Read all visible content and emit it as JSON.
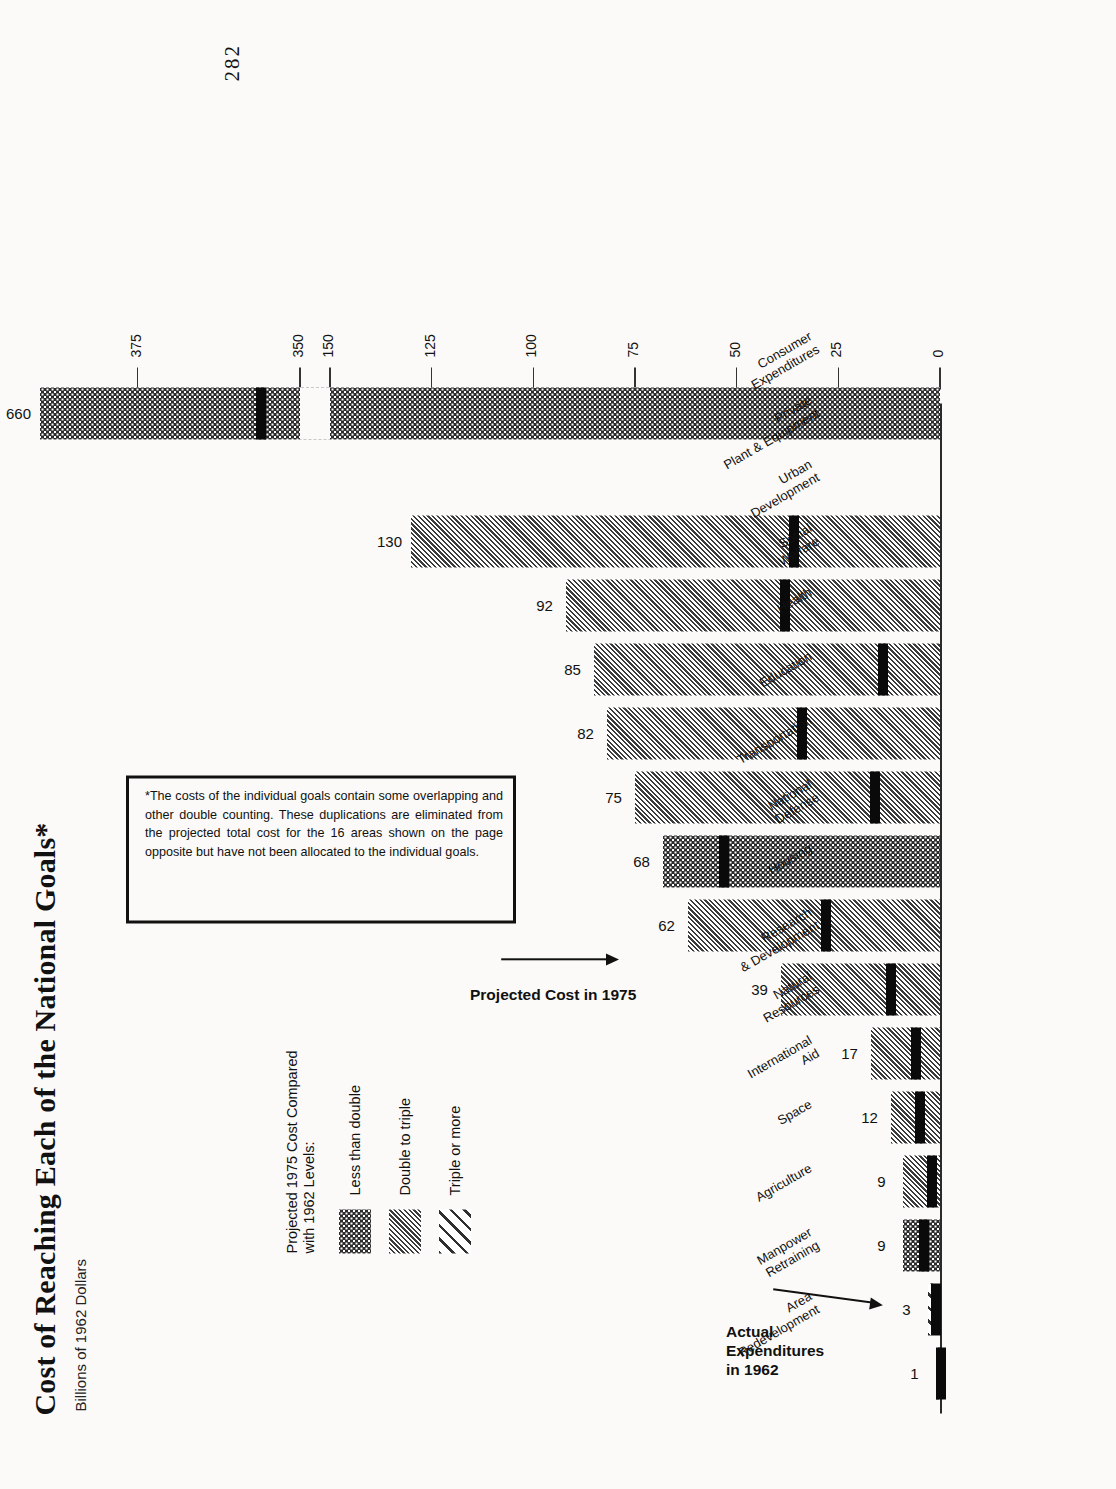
{
  "page": {
    "page_number": "282",
    "title": "Cost of Reaching Each of the National Goals*",
    "subtitle": "Billions of 1962 Dollars"
  },
  "legend": {
    "title_line1": "Projected 1975 Cost Compared",
    "title_line2": "with 1962 Levels:",
    "items": [
      {
        "label": "Less than double",
        "pattern": "dot"
      },
      {
        "label": "Double to triple",
        "pattern": "fine-hatch"
      },
      {
        "label": "Triple or more",
        "pattern": "wide-hatch"
      }
    ]
  },
  "footnote": {
    "text": "*The costs of the individual goals contain some overlapping and other double counting. These duplications are eliminated from the projected total cost for the 16 areas shown on the page opposite but have not been allocated to the individual goals."
  },
  "annotations": {
    "actual_line1": "Actual",
    "actual_line2": "Expenditures",
    "actual_line3": "in 1962",
    "projected": "Projected Cost in 1975"
  },
  "chart_data": {
    "type": "bar",
    "title": "Cost of Reaching Each of the National Goals*",
    "subtitle": "Billions of 1962 Dollars",
    "xlabel": "",
    "ylabel": "Billions of 1962 Dollars",
    "orientation": "vertical",
    "grid": false,
    "legend_position": "upper-left",
    "axis_break": {
      "from": 150,
      "to": 350
    },
    "ylim": [
      0,
      390
    ],
    "tick_labels": [
      "0",
      "25",
      "50",
      "75",
      "100",
      "125",
      "150",
      "350",
      "375"
    ],
    "tick_values": [
      0,
      25,
      50,
      75,
      100,
      125,
      150,
      350,
      375
    ],
    "categories": [
      "Consumer Expenditures",
      "Private Plant & Equipment",
      "Urban Development",
      "Social Welfare",
      "Health",
      "Education",
      "Transportation",
      "National Defense",
      "Housing",
      "Research & Development",
      "Natural Resources",
      "International Aid",
      "Space",
      "Agriculture",
      "Manpower Retraining",
      "Area Redevelopment"
    ],
    "series": [
      {
        "name": "Projected Cost in 1975",
        "values": [
          660,
          152,
          130,
          92,
          85,
          82,
          75,
          68,
          62,
          39,
          17,
          12,
          9,
          9,
          3,
          1
        ]
      },
      {
        "name": "Actual Expenditures in 1962",
        "values": [
          356,
          50,
          36,
          38,
          14,
          34,
          16,
          53,
          28,
          12,
          6,
          5,
          2,
          4,
          1,
          0.3
        ]
      }
    ],
    "patterns": [
      "dot",
      "wide-hatch",
      "fine-hatch",
      "fine-hatch",
      "fine-hatch",
      "fine-hatch",
      "fine-hatch",
      "dot",
      "fine-hatch",
      "fine-hatch",
      "fine-hatch",
      "fine-hatch",
      "fine-hatch",
      "dot",
      "wide-hatch",
      "wide-hatch"
    ],
    "labels": [
      "660",
      "152",
      "130",
      "92",
      "85",
      "82",
      "75",
      "68",
      "62",
      "39",
      "17",
      "12",
      "9",
      "9",
      "3",
      "1"
    ]
  }
}
